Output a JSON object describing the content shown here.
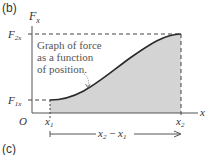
{
  "panels": {
    "top": "(b)",
    "bottom": "(c)"
  },
  "axes": {
    "y_label": "F",
    "y_label_sub": "x",
    "x_label": "x",
    "origin": "O"
  },
  "levels": {
    "f2": "F",
    "f2_sub": "2x",
    "f1": "F",
    "f1_sub": "1x"
  },
  "positions": {
    "x1": "x",
    "x1_sub": "1",
    "x2": "x",
    "x2_sub": "2"
  },
  "annotation": {
    "line1": "Graph of force",
    "line2": "as a function",
    "line3": "of position."
  },
  "interval": {
    "a": "x",
    "a_sub": "2",
    "minus": " − ",
    "b": "x",
    "b_sub": "1"
  },
  "colors": {
    "fill": "#d4d4d4",
    "curve": "#2a2a2a",
    "axis": "#555555",
    "dash": "#444444"
  }
}
